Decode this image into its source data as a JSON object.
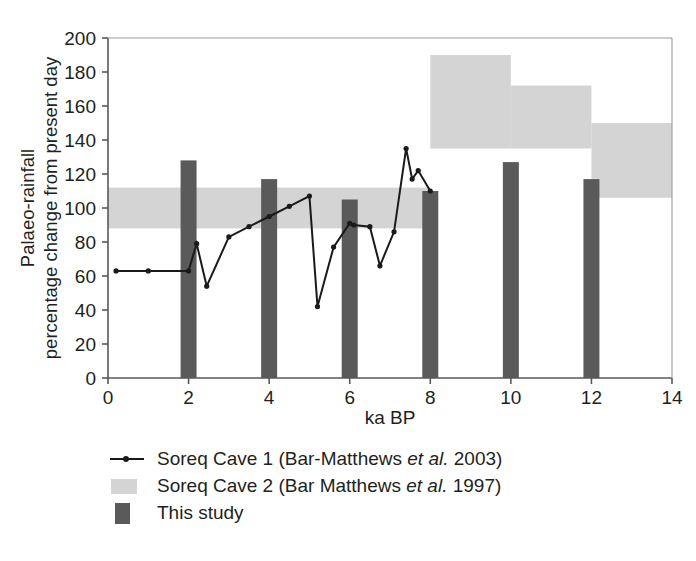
{
  "chart_data": {
    "type": "line",
    "title": "",
    "xlabel": "ka BP",
    "ylabel": "Palaeo-rainfall percentage change from present day",
    "ylabel_line1": "Palaeo-rainfall",
    "ylabel_line2": "percentage change from present day",
    "xlim": [
      0,
      14
    ],
    "ylim": [
      0,
      200
    ],
    "xticks": [
      0,
      2,
      4,
      6,
      8,
      10,
      12,
      14
    ],
    "yticks": [
      0,
      20,
      40,
      60,
      80,
      100,
      120,
      140,
      160,
      180,
      200
    ],
    "grid": false,
    "legend_position": "below-left",
    "series": [
      {
        "name": "Soreq Cave 1 (Bar-Matthews et al. 2003)",
        "type": "line",
        "marker": "dot",
        "color": "#1a1a1a",
        "points": [
          [
            0.2,
            63
          ],
          [
            1.0,
            63
          ],
          [
            2.0,
            63
          ],
          [
            2.2,
            79
          ],
          [
            2.45,
            54
          ],
          [
            3.0,
            83
          ],
          [
            3.5,
            89
          ],
          [
            4.0,
            95
          ],
          [
            4.5,
            101
          ],
          [
            5.0,
            107
          ],
          [
            5.2,
            42
          ],
          [
            5.6,
            77
          ],
          [
            6.0,
            91
          ],
          [
            6.1,
            90
          ],
          [
            6.5,
            89
          ],
          [
            6.75,
            66
          ],
          [
            7.1,
            86
          ],
          [
            7.4,
            135
          ],
          [
            7.55,
            117
          ],
          [
            7.7,
            122
          ],
          [
            8.0,
            110
          ]
        ]
      },
      {
        "name": "Soreq Cave 2 (Bar Matthews et al. 1997)",
        "type": "band",
        "color": "#d4d4d4",
        "bands": [
          {
            "x0": 0,
            "x1": 8,
            "y0": 88,
            "y1": 112
          },
          {
            "x0": 8,
            "x1": 10,
            "y0": 135,
            "y1": 190
          },
          {
            "x0": 10,
            "x1": 12,
            "y0": 135,
            "y1": 172
          },
          {
            "x0": 12,
            "x1": 14,
            "y0": 106,
            "y1": 150
          }
        ]
      },
      {
        "name": "This study",
        "type": "bar",
        "color": "#5a5a5a",
        "categories": [
          2,
          4,
          6,
          8,
          10,
          12
        ],
        "values": [
          128,
          117,
          105,
          110,
          127,
          117
        ]
      }
    ]
  },
  "legend": {
    "items": [
      {
        "key": "line",
        "label_pre": "Soreq Cave 1 (Bar-Matthews ",
        "label_italic": "et al.",
        "label_post": " 2003)"
      },
      {
        "key": "light-swatch",
        "label_pre": "Soreq Cave 2 (Bar Matthews ",
        "label_italic": "et al.",
        "label_post": " 1997)"
      },
      {
        "key": "dark-swatch",
        "label_pre": "This study",
        "label_italic": "",
        "label_post": ""
      }
    ]
  },
  "colors": {
    "band": "#d4d4d4",
    "bar": "#5a5a5a",
    "line": "#1a1a1a",
    "axis": "#595959",
    "text": "#231f20"
  }
}
